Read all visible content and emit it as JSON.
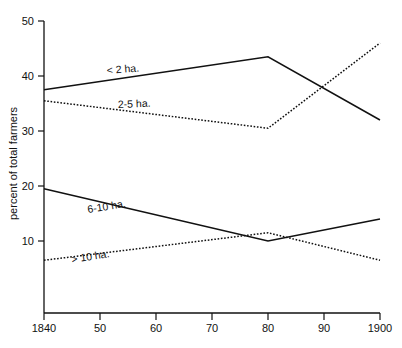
{
  "chart_data": {
    "type": "line",
    "title": "",
    "xlabel": "",
    "ylabel": "percent of total farmers",
    "xlim": [
      1840,
      1900
    ],
    "ylim": [
      0,
      50
    ],
    "grid": false,
    "legend_position": "inline-labels",
    "x": [
      1840,
      1880,
      1900
    ],
    "xtick_values": [
      1840,
      1850,
      1860,
      1870,
      1880,
      1890,
      1900
    ],
    "xtick_labels": [
      "1840",
      "50",
      "60",
      "70",
      "80",
      "90",
      "1900"
    ],
    "ytick_values": [
      10,
      20,
      30,
      40,
      50
    ],
    "ytick_labels": [
      "10",
      "20",
      "30",
      "40",
      "50"
    ],
    "series": [
      {
        "name": "< 2 ha.",
        "style": "solid",
        "label": "< 2 ha.",
        "values": [
          37.5,
          43.5,
          32
        ]
      },
      {
        "name": "2-5 ha.",
        "style": "dotted",
        "label": "2-5 ha.",
        "values": [
          35.5,
          30.5,
          46
        ]
      },
      {
        "name": "6-10 ha.",
        "style": "solid",
        "label": "6-10 ha.",
        "values": [
          19.5,
          10.0,
          14
        ]
      },
      {
        "name": "> 10 ha.",
        "style": "dotted",
        "label": "> 10 ha.",
        "values": [
          6.5,
          11.5,
          6.5
        ]
      }
    ]
  },
  "axes": {
    "y_title": "percent of total farmers",
    "y_ticks": [
      "50",
      "40",
      "30",
      "20",
      "10"
    ],
    "x_ticks": [
      "1840",
      "50",
      "60",
      "70",
      "80",
      "90",
      "1900"
    ]
  },
  "series_labels": {
    "lt2": "< 2 ha.",
    "two_five": "2-5 ha.",
    "six_ten": "6-10 ha.",
    "gt10": "> 10 ha."
  },
  "colors": {
    "ink": "#111111",
    "background": "#ffffff"
  }
}
